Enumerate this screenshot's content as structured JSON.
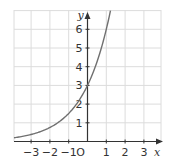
{
  "chart_data": {
    "type": "line",
    "title": "",
    "xlabel": "x",
    "ylabel": "y",
    "origin_label": "O",
    "function": "y = 3·2^x",
    "xlim": [
      -4.0,
      3.9
    ],
    "ylim": [
      0,
      7
    ],
    "grid": true,
    "x_ticks": [
      -3,
      -2,
      -1,
      1,
      2,
      3
    ],
    "x_tick_labels": [
      "−3",
      "−2",
      "−1",
      "1",
      "2",
      "3"
    ],
    "y_ticks": [
      1,
      2,
      3,
      4,
      5,
      6
    ],
    "y_tick_labels": [
      "1",
      "2",
      "3",
      "4",
      "5",
      "6"
    ],
    "series": [
      {
        "name": "curve",
        "x": [
          -4,
          -3,
          -2,
          -1,
          0,
          1,
          1.22
        ],
        "y": [
          0.19,
          0.38,
          0.75,
          1.5,
          3,
          6,
          7
        ],
        "color": "#707070"
      }
    ],
    "colors": {
      "grid": "#dcdcdc",
      "axis": "#333333",
      "curve": "#707070"
    }
  }
}
